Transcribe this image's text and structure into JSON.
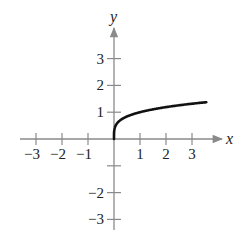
{
  "chart_data": {
    "type": "line",
    "title": "",
    "xlabel": "x",
    "ylabel": "y",
    "xlim": [
      -3.5,
      4
    ],
    "ylim": [
      -3.3,
      4
    ],
    "grid": false,
    "legend": null,
    "x_ticks": [
      -3,
      -2,
      -1,
      1,
      2,
      3
    ],
    "x_tick_labels": [
      "−3",
      "−2",
      "−1",
      "1",
      "2",
      "3"
    ],
    "y_ticks": [
      -3,
      -2,
      -1,
      1,
      2,
      3
    ],
    "y_tick_labels": [
      "−3",
      "−2",
      "",
      "1",
      "2",
      "3"
    ],
    "series": [
      {
        "name": "y = x^(1/4)",
        "x": [
          0,
          0.01,
          0.05,
          0.1,
          0.25,
          0.5,
          1,
          1.5,
          2,
          2.5,
          3,
          3.5
        ],
        "y": [
          0,
          0.32,
          0.47,
          0.56,
          0.71,
          0.84,
          1.0,
          1.11,
          1.19,
          1.26,
          1.32,
          1.37
        ]
      }
    ],
    "colors": {
      "axis": "#8a8a8a",
      "curve": "#111111",
      "text": "#222222"
    }
  }
}
